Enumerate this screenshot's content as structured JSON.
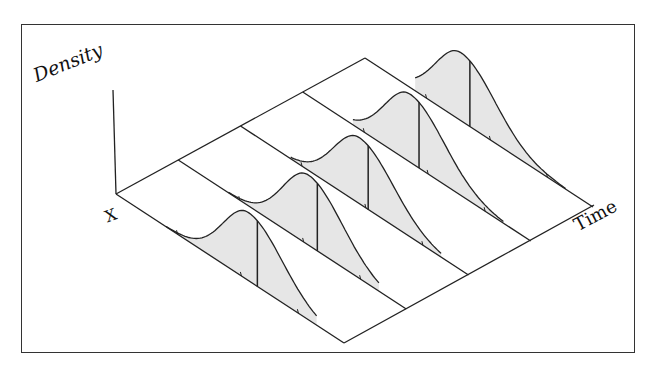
{
  "diagram": {
    "type": "3d-ridgeline-density-over-time",
    "axes": {
      "vertical_label": "Density",
      "x_label": "X",
      "time_label": "Time"
    },
    "num_slices": 5,
    "fill_color": "#e6e6e6",
    "line_color": "#222222",
    "frame_color": "#333333",
    "slices": [
      {
        "index": 1,
        "peak_t": 0.58,
        "height": 68
      },
      {
        "index": 2,
        "peak_t": 0.57,
        "height": 70
      },
      {
        "index": 3,
        "peak_t": 0.52,
        "height": 66
      },
      {
        "index": 4,
        "peak_t": 0.47,
        "height": 68
      },
      {
        "index": 5,
        "peak_t": 0.42,
        "height": 68
      }
    ]
  }
}
